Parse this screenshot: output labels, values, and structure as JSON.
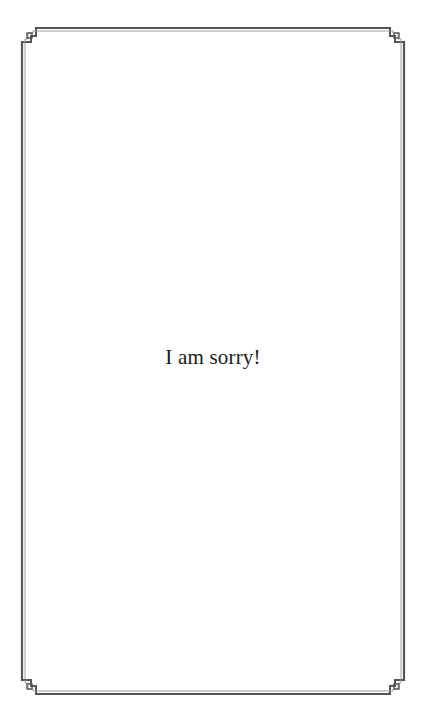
{
  "page": {
    "message": "I am sorry!"
  },
  "frame": {
    "style": "double-line border with stepped corner ornaments",
    "line_color": "#555555",
    "inner_line_color": "#9a9a9a",
    "corners": [
      "top-left",
      "top-right",
      "bottom-left",
      "bottom-right"
    ]
  }
}
